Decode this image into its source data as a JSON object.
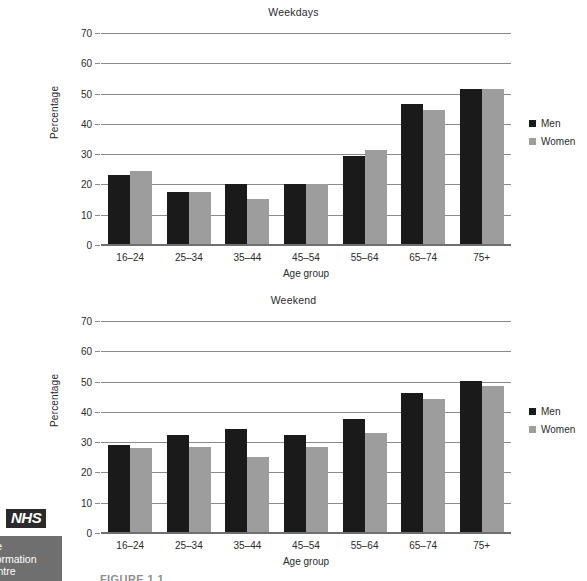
{
  "chart_data": [
    {
      "type": "bar",
      "title": "Weekdays",
      "xlabel": "Age group",
      "ylabel": "Percentage",
      "ylim": [
        0,
        70
      ],
      "yticks": [
        0,
        10,
        20,
        30,
        40,
        50,
        60,
        70
      ],
      "grid": true,
      "legend_position": "right",
      "categories": [
        "16–24",
        "25–34",
        "35–44",
        "45–54",
        "55–64",
        "65–74",
        "75+"
      ],
      "series": [
        {
          "name": "Men",
          "color": "#1a1a1a",
          "values": [
            23.0,
            17.5,
            20.0,
            20.0,
            29.3,
            46.5,
            51.5
          ]
        },
        {
          "name": "Women",
          "color": "#9d9d9d",
          "values": [
            24.3,
            17.5,
            15.3,
            20.0,
            31.3,
            44.5,
            51.5
          ]
        }
      ]
    },
    {
      "type": "bar",
      "title": "Weekend",
      "xlabel": "Age group",
      "ylabel": "Percentage",
      "ylim": [
        0,
        70
      ],
      "yticks": [
        0,
        10,
        20,
        30,
        40,
        50,
        60,
        70
      ],
      "grid": true,
      "legend_position": "right",
      "categories": [
        "16–24",
        "25–34",
        "35–44",
        "45–54",
        "55–64",
        "65–74",
        "75+"
      ],
      "series": [
        {
          "name": "Men",
          "color": "#1a1a1a",
          "values": [
            29.2,
            32.2,
            34.5,
            32.3,
            37.5,
            46.2,
            50.3
          ]
        },
        {
          "name": "Women",
          "color": "#9d9d9d",
          "values": [
            28.2,
            28.5,
            25.2,
            28.3,
            33.0,
            44.3,
            48.5
          ]
        }
      ]
    }
  ],
  "branding": {
    "nhs_logo_text": "NHS",
    "sub_text_line1": "The",
    "sub_text_line2": "Information",
    "sub_text_line3": "Centre"
  },
  "caption": {
    "text": "FIGURE 1.1"
  }
}
